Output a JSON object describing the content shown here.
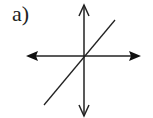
{
  "figure": {
    "label": "a)",
    "axes": {
      "horizontal": {
        "arrows": "both",
        "style": "filled"
      },
      "vertical": {
        "arrows": "both",
        "style": "open"
      }
    },
    "line": {
      "slope": "positive",
      "passes_through_origin": true
    },
    "colors": {
      "stroke": "#222222",
      "background": "#ffffff"
    }
  }
}
